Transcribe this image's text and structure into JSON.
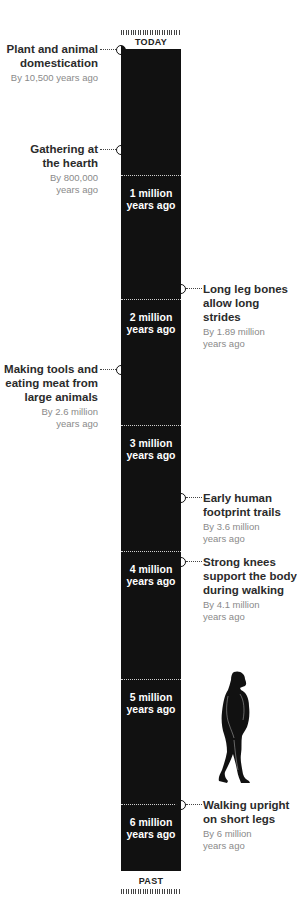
{
  "timeline": {
    "top_label": "TODAY",
    "bottom_label": "PAST",
    "million_markers": [
      {
        "line1": "1 million",
        "line2": "years ago"
      },
      {
        "line1": "2 million",
        "line2": "years ago"
      },
      {
        "line1": "3 million",
        "line2": "years ago"
      },
      {
        "line1": "4 million",
        "line2": "years ago"
      },
      {
        "line1": "5 million",
        "line2": "years ago"
      },
      {
        "line1": "6 million",
        "line2": "years ago"
      }
    ],
    "colors": {
      "bar": "#111111",
      "title_text": "#2b2b2b",
      "date_text": "#8a8a8a",
      "divider": "#cfcfcf"
    }
  },
  "events": [
    {
      "side": "left",
      "title_1": "Plant and animal",
      "title_2": "domestication",
      "title_3": "",
      "date_1": "By 10,500 years ago",
      "date_2": ""
    },
    {
      "side": "left",
      "title_1": "Gathering at",
      "title_2": "the hearth",
      "title_3": "",
      "date_1": "By 800,000",
      "date_2": "years ago"
    },
    {
      "side": "right",
      "title_1": "Long leg bones",
      "title_2": "allow long strides",
      "title_3": "",
      "date_1": "By 1.89 million",
      "date_2": "years ago"
    },
    {
      "side": "left",
      "title_1": "Making tools and",
      "title_2": "eating meat from",
      "title_3": "large animals",
      "date_1": "By 2.6 million",
      "date_2": "years ago"
    },
    {
      "side": "right",
      "title_1": "Early human",
      "title_2": "footprint trails",
      "title_3": "",
      "date_1": "By 3.6 million",
      "date_2": "years ago"
    },
    {
      "side": "right",
      "title_1": "Strong knees",
      "title_2": "support the body",
      "title_3": "during walking",
      "date_1": "By 4.1 million",
      "date_2": "years ago"
    },
    {
      "side": "right",
      "title_1": "Walking upright",
      "title_2": "on short legs",
      "title_3": "",
      "date_1": "By 6 million",
      "date_2": "years ago"
    }
  ],
  "illustration": {
    "icon": "early-hominid-silhouette-icon"
  }
}
